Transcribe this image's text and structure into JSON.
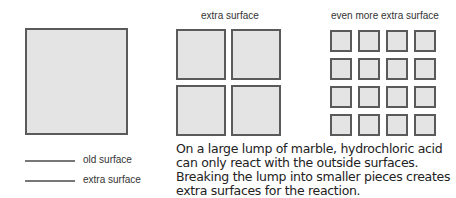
{
  "diagram": {
    "panels": [
      {
        "label": "",
        "pieces": 1
      },
      {
        "label": "extra surface",
        "pieces": 4
      },
      {
        "label": "even more extra surface",
        "pieces": 16
      }
    ],
    "legend": [
      {
        "label": "old surface"
      },
      {
        "label": "extra surface"
      }
    ],
    "caption_lines": [
      "On a large lump of marble, hydrochloric acid",
      "can only react with the outside surfaces.",
      "Breaking the lump into smaller pieces creates",
      "extra surfaces for the reaction."
    ],
    "colors": {
      "fill": "#e4e4e4",
      "border": "#5a5a5a",
      "legend_line": "#777777"
    }
  }
}
